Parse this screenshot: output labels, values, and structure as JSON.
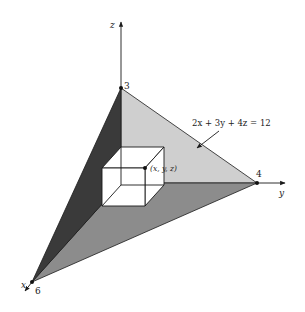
{
  "figure": {
    "axes": {
      "x_label": "x",
      "y_label": "y",
      "z_label": "z"
    },
    "intercepts": {
      "x": "6",
      "y": "4",
      "z": "3"
    },
    "plane_equation": "2x + 3y + 4z = 12",
    "point_label": "(x, y, z)",
    "colors": {
      "xz_face": "#3a3a3a",
      "yz_face": "#cfcfcf",
      "xy_face": "#8c8c8c",
      "box_face": "#ffffff",
      "line": "#1a1a1a"
    }
  }
}
